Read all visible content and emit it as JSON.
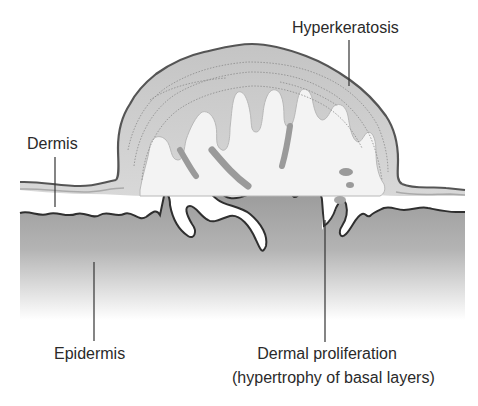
{
  "figure": {
    "type": "cross-section illustration",
    "colors": {
      "background": "#ffffff",
      "outline": "#3a3a3a",
      "keratin_fill": "#c9c9c9",
      "keratin_inner": "#f2f2f2",
      "basal_fill_top": "#9a9a9a",
      "basal_fill_bottom": "#ffffff",
      "streak": "#9e9e9e",
      "label_text": "#2a2a2a"
    }
  },
  "labels": {
    "hyperkeratosis": "Hyperkeratosis",
    "dermis": "Dermis",
    "epidermis": "Epidermis",
    "dermal_proliferation_line1": "Dermal proliferation",
    "dermal_proliferation_line2": "(hypertrophy of basal layers)"
  }
}
